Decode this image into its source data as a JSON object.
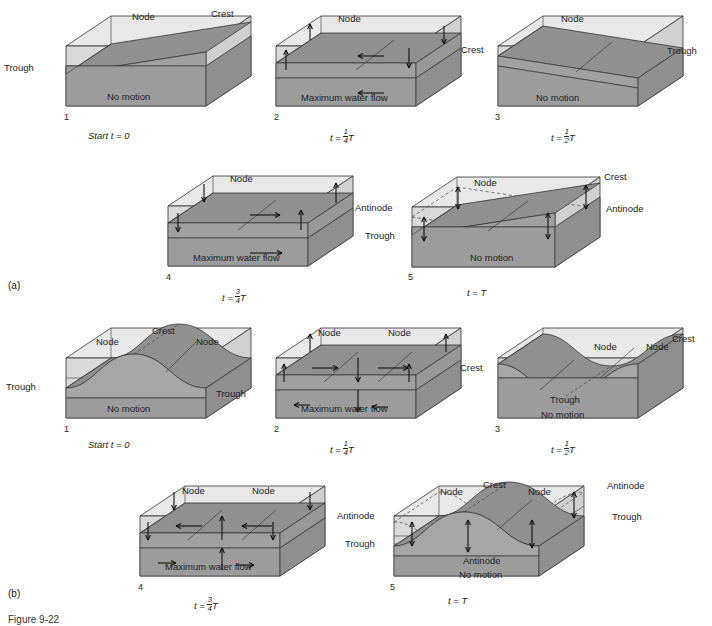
{
  "figure": {
    "caption": "Figure 9-22",
    "sections": [
      {
        "id": "a",
        "label": "(a)"
      },
      {
        "id": "b",
        "label": "(b)"
      }
    ]
  },
  "common_labels": {
    "node": "Node",
    "crest": "Crest",
    "trough": "Trough",
    "antinode": "Antinode",
    "no_motion": "No motion",
    "max_flow": "Maximum water flow",
    "start": "Start",
    "t_equals": "t =",
    "period": "T"
  },
  "colors": {
    "box_front_light": "#d9d9d9",
    "box_top_light": "#e8e8e8",
    "water_dark": "#8f8f8f",
    "water_mid": "#a8a8a8",
    "outline": "#333333",
    "dashed": "#444444",
    "text": "#222222",
    "background": "#ffffff"
  },
  "section_a": {
    "label": "(a)",
    "mode": "single-node seiche (fundamental)",
    "panels": [
      {
        "number": "1",
        "time": "Start t = 0",
        "time_prefix": "Start t =",
        "time_value": "0",
        "labels": [
          "Node",
          "Crest",
          "Trough",
          "No motion"
        ],
        "node_label": "Node",
        "left_label": "Trough",
        "right_label": "Crest",
        "base_label": "No motion",
        "arrows": []
      },
      {
        "number": "2",
        "time": "t = 1/4 T",
        "time_prefix": "t =",
        "numerator": "1",
        "denominator": "4",
        "time_value": "T",
        "labels": [
          "Node",
          "Maximum water flow"
        ],
        "node_label": "Node",
        "base_label": "Maximum water flow",
        "arrows": [
          "left",
          "up",
          "down"
        ]
      },
      {
        "number": "3",
        "time": "t = 1/2 T",
        "time_prefix": "t =",
        "numerator": "1",
        "denominator": "2",
        "time_value": "T",
        "labels": [
          "Node",
          "Crest",
          "Trough",
          "No motion"
        ],
        "node_label": "Node",
        "left_label": "Crest",
        "right_label": "Trough",
        "base_label": "No motion",
        "arrows": []
      },
      {
        "number": "4",
        "time": "t = 3/4 T",
        "time_prefix": "t =",
        "numerator": "3",
        "denominator": "4",
        "time_value": "T",
        "labels": [
          "Node",
          "Maximum water flow"
        ],
        "node_label": "Node",
        "base_label": "Maximum water flow",
        "arrows": [
          "right",
          "up",
          "down"
        ]
      },
      {
        "number": "5",
        "time": "t = T",
        "time_prefix": "t =",
        "time_value": "T",
        "labels": [
          "Node",
          "Crest",
          "Antinode",
          "Antinode",
          "Trough",
          "No motion"
        ],
        "node_label": "Node",
        "right_top_label": "Crest",
        "right_mid_label": "Antinode",
        "left_top_label": "Antinode",
        "left_mid_label": "Trough",
        "base_label": "No motion",
        "arrows": [
          "up-down"
        ]
      }
    ]
  },
  "section_b": {
    "label": "(b)",
    "mode": "two-node seiche (first harmonic)",
    "panels": [
      {
        "number": "1",
        "time": "Start t = 0",
        "time_prefix": "Start t =",
        "time_value": "0",
        "labels": [
          "Node",
          "Crest",
          "Node",
          "Trough",
          "Trough",
          "No motion"
        ],
        "node_label_left": "Node",
        "node_label_right": "Node",
        "crest_label": "Crest",
        "left_label": "Trough",
        "right_label": "Trough",
        "base_label": "No motion",
        "arrows": []
      },
      {
        "number": "2",
        "time": "t = 1/4 T",
        "time_prefix": "t =",
        "numerator": "1",
        "denominator": "4",
        "time_value": "T",
        "labels": [
          "Node",
          "Node",
          "Maximum water flow"
        ],
        "node_label_left": "Node",
        "node_label_right": "Node",
        "base_label": "Maximum water flow",
        "arrows": [
          "right",
          "down",
          "right",
          "up",
          "left"
        ]
      },
      {
        "number": "3",
        "time": "t = 1/2 T",
        "time_prefix": "t =",
        "numerator": "1",
        "denominator": "2",
        "time_value": "T",
        "labels": [
          "Node",
          "Node",
          "Crest",
          "Crest",
          "Trough",
          "No motion"
        ],
        "node_label_left": "Node",
        "node_label_right": "Node",
        "left_label": "Crest",
        "right_label": "Crest",
        "trough_label": "Trough",
        "base_label": "No motion",
        "arrows": []
      },
      {
        "number": "4",
        "time": "t = 3/4 T",
        "time_prefix": "t =",
        "numerator": "3",
        "denominator": "4",
        "time_value": "T",
        "labels": [
          "Node",
          "Node",
          "Maximum water flow"
        ],
        "node_label_left": "Node",
        "node_label_right": "Node",
        "base_label": "Maximum water flow",
        "arrows": [
          "left",
          "up",
          "left",
          "down",
          "right"
        ]
      },
      {
        "number": "5",
        "time": "t = T",
        "time_prefix": "t =",
        "time_value": "T",
        "labels": [
          "Node",
          "Crest",
          "Node",
          "Antinode",
          "Antinode",
          "Trough",
          "Trough",
          "Antinode",
          "No motion"
        ],
        "node_label_left": "Node",
        "node_label_right": "Node",
        "crest_label": "Crest",
        "right_top_label": "Antinode",
        "right_mid_label": "Trough",
        "left_top_label": "Antinode",
        "left_mid_label": "Trough",
        "center_label": "Antinode",
        "base_label": "No motion",
        "arrows": [
          "up-down",
          "up-down",
          "up-down"
        ]
      }
    ]
  }
}
